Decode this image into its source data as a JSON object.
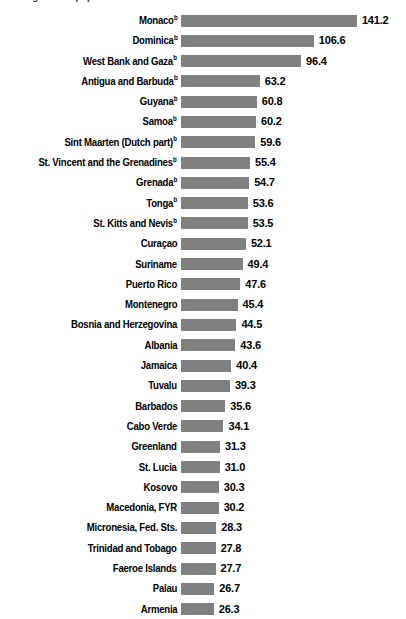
{
  "chart_data": {
    "type": "bar",
    "orientation": "horizontal",
    "title": "...ming as % of population",
    "xlabel": "",
    "ylabel": "",
    "grid": false,
    "legend": null,
    "xlim": [
      0,
      141.2
    ],
    "value_format": "one-decimal",
    "footnote_marker": "b",
    "categories": [
      "Monaco",
      "Dominica",
      "West Bank and Gaza",
      "Antigua and Barbuda",
      "Guyana",
      "Samoa",
      "Sint Maarten (Dutch part)",
      "St. Vincent and the Grenadines",
      "Grenada",
      "Tonga",
      "St. Kitts and Nevis",
      "Curaçao",
      "Suriname",
      "Puerto Rico",
      "Montenegro",
      "Bosnia and Herzegovina",
      "Albania",
      "Jamaica",
      "Tuvalu",
      "Barbados",
      "Cabo Verde",
      "Greenland",
      "St. Lucia",
      "Kosovo",
      "Macedonia, FYR",
      "Micronesia, Fed. Sts.",
      "Trinidad and Tobago",
      "Faeroe Islands",
      "Palau",
      "Armenia"
    ],
    "values": [
      141.2,
      106.6,
      96.4,
      63.2,
      60.8,
      60.2,
      59.6,
      55.4,
      54.7,
      53.6,
      53.5,
      52.1,
      49.4,
      47.6,
      45.4,
      44.5,
      43.6,
      40.4,
      39.3,
      35.6,
      34.1,
      31.3,
      31.0,
      30.3,
      30.2,
      28.3,
      27.8,
      27.7,
      26.7,
      26.3
    ],
    "bars": [
      {
        "label": "Monaco",
        "value": 141.2,
        "value_text": "141.2",
        "marker": "b"
      },
      {
        "label": "Dominica",
        "value": 106.6,
        "value_text": "106.6",
        "marker": "b"
      },
      {
        "label": "West Bank and Gaza",
        "value": 96.4,
        "value_text": "96.4",
        "marker": "b"
      },
      {
        "label": "Antigua and Barbuda",
        "value": 63.2,
        "value_text": "63.2",
        "marker": "b"
      },
      {
        "label": "Guyana",
        "value": 60.8,
        "value_text": "60.8",
        "marker": "b"
      },
      {
        "label": "Samoa",
        "value": 60.2,
        "value_text": "60.2",
        "marker": "b"
      },
      {
        "label": "Sint Maarten (Dutch part)",
        "value": 59.6,
        "value_text": "59.6",
        "marker": "b"
      },
      {
        "label": "St. Vincent and the Grenadines",
        "value": 55.4,
        "value_text": "55.4",
        "marker": "b"
      },
      {
        "label": "Grenada",
        "value": 54.7,
        "value_text": "54.7",
        "marker": "b"
      },
      {
        "label": "Tonga",
        "value": 53.6,
        "value_text": "53.6",
        "marker": "b"
      },
      {
        "label": "St. Kitts and Nevis",
        "value": 53.5,
        "value_text": "53.5",
        "marker": "b"
      },
      {
        "label": "Curaçao",
        "value": 52.1,
        "value_text": "52.1",
        "marker": ""
      },
      {
        "label": "Suriname",
        "value": 49.4,
        "value_text": "49.4",
        "marker": ""
      },
      {
        "label": "Puerto Rico",
        "value": 47.6,
        "value_text": "47.6",
        "marker": ""
      },
      {
        "label": "Montenegro",
        "value": 45.4,
        "value_text": "45.4",
        "marker": ""
      },
      {
        "label": "Bosnia and Herzegovina",
        "value": 44.5,
        "value_text": "44.5",
        "marker": ""
      },
      {
        "label": "Albania",
        "value": 43.6,
        "value_text": "43.6",
        "marker": ""
      },
      {
        "label": "Jamaica",
        "value": 40.4,
        "value_text": "40.4",
        "marker": ""
      },
      {
        "label": "Tuvalu",
        "value": 39.3,
        "value_text": "39.3",
        "marker": ""
      },
      {
        "label": "Barbados",
        "value": 35.6,
        "value_text": "35.6",
        "marker": ""
      },
      {
        "label": "Cabo Verde",
        "value": 34.1,
        "value_text": "34.1",
        "marker": ""
      },
      {
        "label": "Greenland",
        "value": 31.3,
        "value_text": "31.3",
        "marker": ""
      },
      {
        "label": "St. Lucia",
        "value": 31.0,
        "value_text": "31.0",
        "marker": ""
      },
      {
        "label": "Kosovo",
        "value": 30.3,
        "value_text": "30.3",
        "marker": ""
      },
      {
        "label": "Macedonia, FYR",
        "value": 30.2,
        "value_text": "30.2",
        "marker": ""
      },
      {
        "label": "Micronesia, Fed. Sts.",
        "value": 28.3,
        "value_text": "28.3",
        "marker": ""
      },
      {
        "label": "Trinidad and Tobago",
        "value": 27.8,
        "value_text": "27.8",
        "marker": ""
      },
      {
        "label": "Faeroe Islands",
        "value": 27.7,
        "value_text": "27.7",
        "marker": ""
      },
      {
        "label": "Palau",
        "value": 26.7,
        "value_text": "26.7",
        "marker": ""
      },
      {
        "label": "Armenia",
        "value": 26.3,
        "value_text": "26.3",
        "marker": ""
      }
    ]
  },
  "style": {
    "bar_color": "#808080",
    "text_color": "#000000",
    "background": "#ffffff"
  },
  "geometry": {
    "bar_origin_x": 181,
    "px_per_unit": 1.246,
    "row_pitch": 20.3,
    "bar_height": 12,
    "value_gap": 5
  }
}
